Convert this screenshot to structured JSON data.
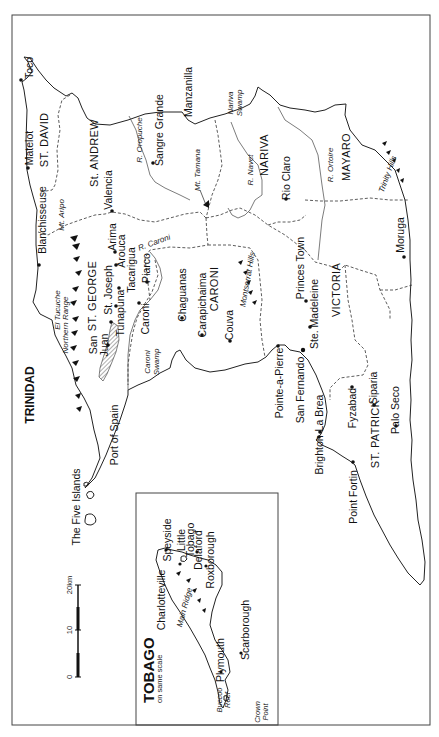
{
  "map": {
    "title": "TRINIDAD",
    "orientation": "rotated 90° counter-clockwise",
    "districts": [
      {
        "name": "ST. DAVID",
        "x": 45,
        "y": 140
      },
      {
        "name": "ST. ANDREW",
        "x": 96,
        "y": 145
      },
      {
        "name": "NARIVA",
        "x": 265,
        "y": 155
      },
      {
        "name": "MAYARO",
        "x": 350,
        "y": 155
      },
      {
        "name": "ST. GEORGE",
        "x": 95,
        "y": 305
      },
      {
        "name": "CAROLI",
        "x": 210,
        "y": 285
      },
      {
        "name": "VICTORIA",
        "x": 338,
        "y": 290
      },
      {
        "name": "ST. PATRICK",
        "x": 378,
        "y": 435
      }
    ],
    "towns": [
      {
        "name": "Toco",
        "x": 20,
        "y": 80,
        "dot": [
          20,
          80
        ]
      },
      {
        "name": "Matelot",
        "x": 28,
        "y": 168,
        "dot": [
          28,
          168
        ]
      },
      {
        "name": "Sangre Grande",
        "x": 155,
        "y": 168,
        "dot": [
          152,
          163
        ]
      },
      {
        "name": "Manzanilla",
        "x": 192,
        "y": 115
      },
      {
        "name": "Valencia",
        "x": 112,
        "y": 212,
        "dot": [
          112,
          212
        ]
      },
      {
        "name": "Blanchisseuse",
        "x": 44,
        "y": 262
      },
      {
        "name": "Rio Claro",
        "x": 286,
        "y": 200,
        "dot": [
          286,
          200
        ]
      },
      {
        "name": "Moruga",
        "x": 404,
        "y": 257,
        "dot": [
          404,
          257
        ]
      },
      {
        "name": "Arima",
        "x": 113,
        "y": 250
      },
      {
        "name": "Arouca",
        "x": 118,
        "y": 262
      },
      {
        "name": "Tacarigua",
        "x": 130,
        "y": 292
      },
      {
        "name": "Piarco",
        "x": 147,
        "y": 290
      },
      {
        "name": "St. Joseph",
        "x": 110,
        "y": 303
      },
      {
        "name": "Tunapuna",
        "x": 121,
        "y": 322
      },
      {
        "name": "San Juan",
        "x": 90,
        "y": 347
      },
      {
        "name": "Caroni",
        "x": 139,
        "y": 333
      },
      {
        "name": "Chaguanas",
        "x": 182,
        "y": 320
      },
      {
        "name": "Carapichaima",
        "x": 203,
        "y": 337
      },
      {
        "name": "Couva",
        "x": 230,
        "y": 340
      },
      {
        "name": "Princes Town",
        "x": 300,
        "y": 302
      },
      {
        "name": "Ste. Madeleine",
        "x": 311,
        "y": 352
      },
      {
        "name": "Port of Spain",
        "x": 118,
        "y": 430
      },
      {
        "name": "Pointe-a-Pierre",
        "x": 278,
        "y": 400
      },
      {
        "name": "San Fernando",
        "x": 299,
        "y": 410
      },
      {
        "name": "La Brea",
        "x": 318,
        "y": 433
      },
      {
        "name": "Brighton",
        "x": 318,
        "y": 480
      },
      {
        "name": "Fyzabad",
        "x": 352,
        "y": 425
      },
      {
        "name": "Siparia",
        "x": 373,
        "y": 390
      },
      {
        "name": "Palo Seco",
        "x": 397,
        "y": 430
      },
      {
        "name": "Point Fortin",
        "x": 352,
        "y": 515
      },
      {
        "name": "The Five Islands",
        "x": 80,
        "y": 530
      }
    ],
    "features": [
      {
        "name": "R. Oropuche",
        "italic": true
      },
      {
        "name": "Nariva Swamp",
        "italic": true
      },
      {
        "name": "Mt. Tamana",
        "italic": true
      },
      {
        "name": "R. Navet",
        "italic": true
      },
      {
        "name": "R. Ortoire",
        "italic": true
      },
      {
        "name": "Trinity Hills",
        "italic": true
      },
      {
        "name": "Mt. Aripo",
        "italic": true
      },
      {
        "name": "R. Caroni",
        "italic": true
      },
      {
        "name": "El Tucuche",
        "italic": true
      },
      {
        "name": "Northern Range",
        "italic": true
      },
      {
        "name": "Caroni Swamp",
        "italic": true
      },
      {
        "name": "Montserrat Hills",
        "italic": true
      }
    ]
  },
  "inset": {
    "title": "TOBAGO",
    "subtitle": "on same scale",
    "towns": [
      "Charlotteville",
      "Speyside",
      "Little Tobago",
      "Delaford",
      "Roxborough",
      "Plymouth",
      "Scarborough"
    ],
    "features": [
      "Main Ridge",
      "Buccoo Reef",
      "Crown Point"
    ]
  },
  "scale_bar": {
    "ticks": [
      "0",
      "10",
      "20km"
    ]
  },
  "labels": {
    "trinidad": "TRINIDAD",
    "st_david": "ST. DAVID",
    "st_andrew": "St. ANDREW",
    "nariva": "NARIVA",
    "mayaro": "MAYARO",
    "st_george": "ST. GEORGE",
    "caroni_d": "CARONI",
    "victoria": "VICTORIA",
    "st_patrick": "ST. PATRICK",
    "toco": "Toco",
    "matelot": "Matelot",
    "sangre": "Sangre Grande",
    "manzanilla": "Manzanilla",
    "valencia": "Valencia",
    "blanch": "Blanchisseuse",
    "rio_claro": "Rio Claro",
    "moruga": "Moruga",
    "arima": "Arima",
    "arouca": "Arouca",
    "tacarigua": "Tacarigua",
    "piarco": "Piarco",
    "st_joseph": "St. Joseph",
    "tunapuna": "Tunapuna",
    "san": "San",
    "juan": "Juan",
    "caroni": "Caroni",
    "chaguanas": "Chaguanas",
    "carapichaima": "Carapichaima",
    "couva": "Couva",
    "princes_town": "Princes Town",
    "ste_madeleine": "Ste. Madeleine",
    "port_of_spain": "Port of Spain",
    "pointe_a_pierre": "Pointe-a-Pierre",
    "san_fernando": "San Fernando",
    "la_brea": "La Brea",
    "brighton": "Brighton",
    "fyzabad": "Fyzabad",
    "siparia": "Siparia",
    "palo_seco": "Palo Seco",
    "point_fortin": "Point Fortin",
    "five_islands": "The Five Islands",
    "r_oropuche": "R. Oropuche",
    "nariva_l1": "Nariva",
    "nariva_l2": "Swamp",
    "mt_tamana": "Mt. Tamana",
    "r_navet": "R. Navet",
    "r_ortoire": "R. Ortoire",
    "trinity_hills": "Trinity Hills",
    "mt_aripo": "Mt. Aripo",
    "r_caroni": "R. Caroni",
    "el_tucuche": "El Tucuche",
    "northern_range": "Northern Range",
    "caroni_swamp_1": "Caroni",
    "caroni_swamp_2": "Swamp",
    "montserrat_hills": "Montserrat Hills",
    "tobago": "TOBAGO",
    "same_scale": "on same scale",
    "charlotteville": "Charlotteville",
    "speyside": "Speyside",
    "little": "Little",
    "tobago_small": "Tobago",
    "delaford": "Delaford",
    "roxborough": "Roxborough",
    "main_ridge": "Main Ridge",
    "plymouth": "Plymouth",
    "scarborough": "Scarborough",
    "buccoo_1": "Buccoo",
    "buccoo_2": "Reef",
    "crown_1": "Crown",
    "crown_2": "Point",
    "scale_0": "0",
    "scale_10": "10",
    "scale_20": "20km"
  }
}
